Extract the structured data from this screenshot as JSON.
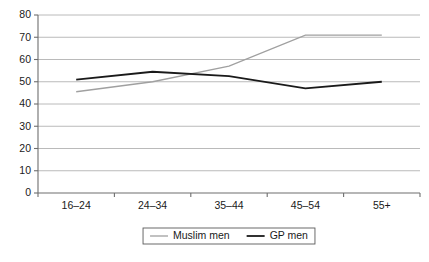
{
  "chart_data": {
    "type": "line",
    "title": "",
    "subtitle": "",
    "xlabel": "",
    "ylabel": "",
    "categories": [
      "16–24",
      "24–34",
      "35–44",
      "45–54",
      "55+"
    ],
    "series": [
      {
        "name": "Muslim men",
        "values": [
          45.5,
          50,
          57,
          71,
          71
        ],
        "color": "#a0a0a0",
        "stroke_width": 1.3
      },
      {
        "name": "GP men",
        "values": [
          51,
          54.5,
          52.5,
          47,
          50
        ],
        "color": "#1a1a1a",
        "stroke_width": 1.8
      }
    ],
    "ylim": [
      0,
      80
    ],
    "ytick_step": 10,
    "yticks": [
      0,
      10,
      20,
      30,
      40,
      50,
      60,
      70,
      80
    ],
    "ytick_labels": [
      "0",
      "10",
      "20",
      "30",
      "40",
      "50",
      "60",
      "70",
      "80"
    ],
    "grid": true,
    "grid_axis": "y",
    "grid_color": "#a8a8a8",
    "legend_position": "bottom",
    "background": "#ffffff",
    "axis_color": "#6e6e6e"
  },
  "legend": {
    "entries": [
      {
        "label": "Muslim men",
        "color": "#a0a0a0"
      },
      {
        "label": "GP men",
        "color": "#1a1a1a"
      }
    ]
  }
}
